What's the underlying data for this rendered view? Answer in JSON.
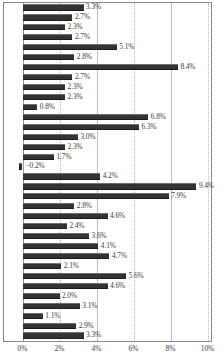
{
  "chart_data": {
    "type": "bar",
    "orientation": "horizontal",
    "title": "",
    "subtitle": "",
    "xlabel": "",
    "ylabel": "",
    "xlim": [
      0,
      10
    ],
    "grid": true,
    "legend": null,
    "xticks": [
      "0%",
      "2%",
      "4%",
      "6%",
      "8%",
      "10%"
    ],
    "xtick_values": [
      0,
      2,
      4,
      6,
      8,
      10
    ],
    "categories": [
      "",
      "",
      "",
      "",
      "",
      "",
      "",
      "",
      "",
      "",
      "",
      "",
      "",
      "",
      "",
      "",
      "",
      "",
      "",
      "",
      "",
      "",
      "",
      "",
      "",
      "",
      "",
      "",
      "",
      "",
      "",
      "",
      "",
      ""
    ],
    "values": [
      3.3,
      2.7,
      2.3,
      2.7,
      5.1,
      2.8,
      8.4,
      2.7,
      2.3,
      2.3,
      0.8,
      6.8,
      6.3,
      3.0,
      2.3,
      1.7,
      -0.2,
      4.2,
      9.4,
      7.9,
      2.8,
      4.6,
      2.4,
      3.6,
      4.1,
      4.7,
      2.1,
      5.6,
      4.6,
      2.0,
      3.1,
      1.1,
      2.9,
      3.3
    ],
    "data_labels": [
      "3.3%",
      "2.7%",
      "2.3%",
      "2.7%",
      "5.1%",
      "2.8%",
      "8.4%",
      "2.7%",
      "2.3%",
      "2.3%",
      "0.8%",
      "6.8%",
      "6.3%",
      "3.0%",
      "2.3%",
      "1.7%",
      "−0.2%",
      "4.2%",
      "9.4%",
      "7.9%",
      "2.8%",
      "4.6%",
      "2.4%",
      "3.6%",
      "4.1%",
      "4.7%",
      "2.1%",
      "5.6%",
      "4.6%",
      "2.0%",
      "3.1%",
      "1.1%",
      "2.9%",
      "3.3%"
    ],
    "bar_color": "#333333",
    "gridline_color": "#b9b9b9"
  }
}
